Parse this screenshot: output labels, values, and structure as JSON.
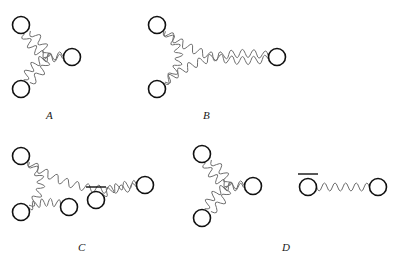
{
  "figure": {
    "title": "",
    "background_color": "#ffffff",
    "vertex_color": "#111111",
    "wave_color": "#6e6e6e",
    "label_color": "#1a1a1a",
    "vertex_radius": 8.5,
    "wave_stroke_width": 1.0,
    "vertex_stroke_width": 1.6
  },
  "panels": [
    {
      "id": "A",
      "label": "A",
      "label_position": {
        "x": 46,
        "y": 110
      },
      "vertices": [
        {
          "name": "a-top-left",
          "x": 21,
          "y": 25,
          "bar": false
        },
        {
          "name": "a-right",
          "x": 72,
          "y": 57,
          "bar": false
        },
        {
          "name": "a-bottom-left",
          "x": 21,
          "y": 89,
          "bar": false
        }
      ],
      "edges": [
        {
          "from": "a-top-left",
          "to": "a-bottom-left",
          "style": "wavy",
          "bulge": -26
        },
        {
          "from": "a-top-left",
          "to": "a-right",
          "style": "wavy",
          "bulge": 14
        },
        {
          "from": "a-bottom-left",
          "to": "a-right",
          "style": "wavy",
          "bulge": -14
        }
      ]
    },
    {
      "id": "B",
      "label": "B",
      "label_position": {
        "x": 203,
        "y": 110
      },
      "vertices": [
        {
          "name": "b-top-left",
          "x": 157,
          "y": 25,
          "bar": false
        },
        {
          "name": "b-right",
          "x": 277,
          "y": 57,
          "bar": false
        },
        {
          "name": "b-bottom-left",
          "x": 157,
          "y": 89,
          "bar": false
        }
      ],
      "edges": [
        {
          "from": "b-top-left",
          "to": "b-bottom-left",
          "style": "wavy",
          "bulge": -22
        },
        {
          "from": "b-top-left",
          "to": "b-right",
          "style": "wavy",
          "bulge": 16
        },
        {
          "from": "b-bottom-left",
          "to": "b-right",
          "style": "wavy",
          "bulge": -16
        }
      ]
    },
    {
      "id": "C",
      "label": "C",
      "label_position": {
        "x": 78,
        "y": 242
      },
      "vertices": [
        {
          "name": "c-top-left",
          "x": 21,
          "y": 156,
          "bar": false
        },
        {
          "name": "c-bottom-left",
          "x": 21,
          "y": 212,
          "bar": false
        },
        {
          "name": "c-mid",
          "x": 69,
          "y": 207,
          "bar": false
        },
        {
          "name": "c-barred",
          "x": 96,
          "y": 200,
          "bar": true
        },
        {
          "name": "c-right",
          "x": 145,
          "y": 185,
          "bar": false
        }
      ],
      "edges": [
        {
          "from": "c-top-left",
          "to": "c-bottom-left",
          "style": "wavy",
          "bulge": -20
        },
        {
          "from": "c-top-left",
          "to": "c-right",
          "style": "wavy",
          "bulge": 16
        },
        {
          "from": "c-bottom-left",
          "to": "c-mid",
          "style": "wavy",
          "bulge": -7
        },
        {
          "from": "c-barred",
          "to": "c-right",
          "style": "wavy",
          "bulge": -6
        }
      ]
    },
    {
      "id": "D",
      "label": "D",
      "label_position": {
        "x": 282,
        "y": 242
      },
      "vertices": [
        {
          "name": "d-top-left",
          "x": 202,
          "y": 154,
          "bar": false
        },
        {
          "name": "d-right",
          "x": 253,
          "y": 186,
          "bar": false
        },
        {
          "name": "d-bottom-left",
          "x": 202,
          "y": 218,
          "bar": false
        },
        {
          "name": "d-barred",
          "x": 308,
          "y": 187,
          "bar": true
        },
        {
          "name": "d-far-right",
          "x": 378,
          "y": 187,
          "bar": false
        }
      ],
      "edges": [
        {
          "from": "d-top-left",
          "to": "d-bottom-left",
          "style": "wavy",
          "bulge": -26
        },
        {
          "from": "d-top-left",
          "to": "d-right",
          "style": "wavy",
          "bulge": 14
        },
        {
          "from": "d-bottom-left",
          "to": "d-right",
          "style": "wavy",
          "bulge": -14
        },
        {
          "from": "d-barred",
          "to": "d-far-right",
          "style": "wavy",
          "bulge": 0
        }
      ]
    }
  ]
}
